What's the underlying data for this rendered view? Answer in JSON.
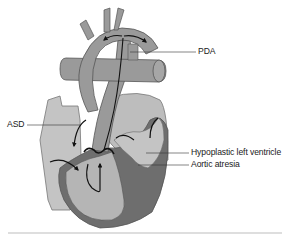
{
  "diagram": {
    "labels": {
      "pda": "PDA",
      "asd": "ASD",
      "hypoplastic_lv": "Hypoplastic left ventricle",
      "aortic_atresia": "Aortic atresia"
    },
    "colors": {
      "background": "#ffffff",
      "vessel_fill": "#9a9a9a",
      "light_chamber": "#c4c4c4",
      "mid_chamber": "#b0b0b0",
      "dark_wall": "#6e6e6e",
      "outline": "#555555",
      "flow_arrow": "#111111",
      "leader_line": "#333333",
      "baseline": "#bdbdbd"
    }
  }
}
